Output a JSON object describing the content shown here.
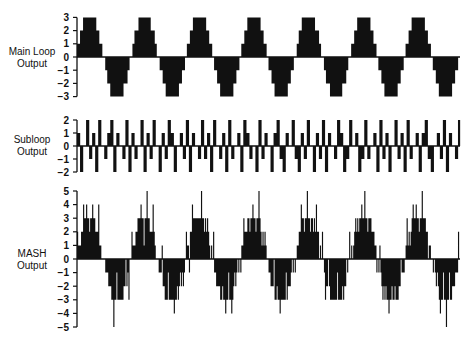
{
  "chart_data": [
    {
      "type": "line",
      "step": true,
      "title": "",
      "ylabel": "Main Loop Output",
      "xlabel": "",
      "ylim": [
        -3,
        3
      ],
      "yticks": [
        3,
        2,
        1,
        0,
        -1,
        -2,
        -3
      ],
      "description": "Quantized staircase sinusoid, 7 periods, levels -3..3",
      "periods": 7,
      "levels_per_half_period": [
        1,
        2,
        3,
        3,
        2,
        1,
        0,
        -1,
        -2,
        -3,
        -3,
        -2,
        -1,
        0
      ]
    },
    {
      "type": "line",
      "step": true,
      "title": "",
      "ylabel": "Subloop Output",
      "xlabel": "",
      "ylim": [
        -2,
        2
      ],
      "yticks": [
        2,
        1,
        0,
        -1,
        -2
      ],
      "description": "Noise-like quantized output toggling between -2 and 2",
      "values": [
        1,
        -2,
        0,
        2,
        -1,
        1,
        -2,
        2,
        0,
        -1,
        1,
        2,
        -2,
        1,
        0,
        -1,
        2,
        -2,
        1,
        -1,
        0,
        2,
        -2,
        1,
        -1,
        2,
        0,
        -2,
        1,
        -1,
        2,
        1,
        -2,
        0,
        1,
        -1,
        2,
        -2,
        1,
        0,
        -1,
        2,
        -1,
        1,
        -2,
        2,
        0,
        -1,
        1,
        -2,
        2,
        -1,
        0,
        1,
        -2,
        2,
        1,
        -1,
        0,
        -2,
        2,
        -1,
        1,
        0,
        -2,
        1,
        2,
        -1,
        -2,
        1,
        0,
        2,
        -1,
        -2,
        1,
        -1,
        2,
        0,
        -2,
        1,
        -1,
        2,
        -2,
        1,
        0,
        -1,
        2,
        1,
        -2,
        -1,
        2,
        0,
        1,
        -2,
        -1,
        2,
        -1,
        0,
        1,
        -2,
        2,
        -1,
        1,
        -2,
        0,
        2,
        -1,
        1,
        -2,
        2,
        -1,
        0,
        1,
        -2,
        1,
        2,
        -1,
        -2,
        0,
        1,
        -1,
        2,
        -2,
        1,
        0,
        -1,
        2,
        -2,
        1,
        -1
      ]
    },
    {
      "type": "line",
      "step": true,
      "title": "",
      "ylabel": "MASH Output",
      "xlabel": "",
      "ylim": [
        -5,
        5
      ],
      "yticks": [
        5,
        4,
        3,
        2,
        1,
        0,
        -1,
        -2,
        -3,
        -4,
        -5
      ],
      "description": "Sum of main loop output and differentiated subloop output; staircase sinusoid with spikes, levels -5..5",
      "periods": 7
    }
  ],
  "panels": [
    {
      "label_line1": "Main Loop",
      "label_line2": "Output"
    },
    {
      "label_line1": "Subloop",
      "label_line2": "Output"
    },
    {
      "label_line1": "MASH",
      "label_line2": "Output"
    }
  ],
  "colors": {
    "ink": "#111111",
    "background": "#ffffff"
  }
}
